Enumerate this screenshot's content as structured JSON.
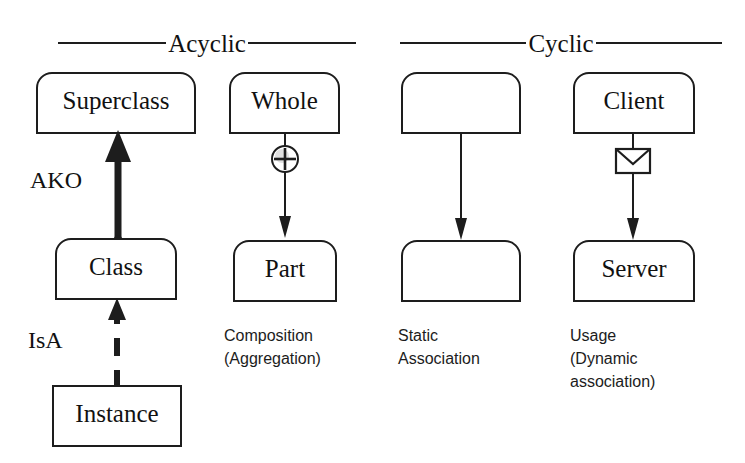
{
  "figure": {
    "background": "#ffffff",
    "ink": "#1d1d1d"
  },
  "headers": [
    {
      "label": "Acyclic",
      "name": "acyclic"
    },
    {
      "label": "Cyclic",
      "name": "cyclic"
    }
  ],
  "columns": [
    {
      "name": "inheritance-instantiation",
      "caption": "",
      "nodes": [
        {
          "name": "superclass",
          "label": "Superclass",
          "shape": "rounded-top"
        },
        {
          "name": "class",
          "label": "Class",
          "shape": "rounded-top"
        },
        {
          "name": "instance",
          "label": "Instance",
          "shape": "square"
        }
      ],
      "edges": [
        {
          "name": "ako-edge",
          "label": "AKO",
          "style": "thick-solid",
          "arrow": "solid-filled"
        },
        {
          "name": "isa-edge",
          "label": "IsA",
          "style": "thick-dashed",
          "arrow": "solid-filled"
        }
      ]
    },
    {
      "name": "composition",
      "caption": "Composition\n(Aggregation)",
      "nodes": [
        {
          "name": "whole",
          "label": "Whole",
          "shape": "rounded-top"
        },
        {
          "name": "part",
          "label": "Part",
          "shape": "rounded-top"
        }
      ],
      "edges": [
        {
          "name": "composition-edge",
          "label": "",
          "style": "thin-solid",
          "arrow": "open-filled",
          "adornment": "circled-plus-icon"
        }
      ]
    },
    {
      "name": "static-association",
      "caption": "Static\nAssociation",
      "nodes": [
        {
          "name": "association-source",
          "label": "",
          "shape": "rounded-top"
        },
        {
          "name": "association-target",
          "label": "",
          "shape": "rounded-top"
        }
      ],
      "edges": [
        {
          "name": "static-association-edge",
          "label": "",
          "style": "thin-solid",
          "arrow": "open-filled",
          "adornment": ""
        }
      ]
    },
    {
      "name": "usage",
      "caption": "Usage\n(Dynamic\nassociation)",
      "nodes": [
        {
          "name": "client",
          "label": "Client",
          "shape": "rounded-top"
        },
        {
          "name": "server",
          "label": "Server",
          "shape": "rounded-top"
        }
      ],
      "edges": [
        {
          "name": "usage-edge",
          "label": "",
          "style": "thin-solid",
          "arrow": "open-filled",
          "adornment": "envelope-icon"
        }
      ]
    }
  ]
}
